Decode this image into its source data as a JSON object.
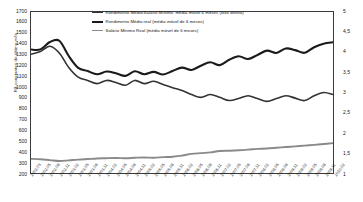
{
  "chart_data": {
    "type": "line",
    "title": "",
    "xlabel": "",
    "ylabel": "R$ constantes do último mês",
    "ylabel_right": "",
    "ylim": [
      200,
      1700
    ],
    "ylim_right": [
      1,
      5
    ],
    "grid": false,
    "legend_position": "top-center",
    "yticks": [
      1700,
      1600,
      1500,
      1400,
      1300,
      1200,
      1100,
      1000,
      900,
      800,
      700,
      600,
      500,
      400,
      300,
      200
    ],
    "yticks_right": [
      5,
      4.5,
      4,
      3.5,
      3,
      2.5,
      2,
      1.5,
      1
    ],
    "x": [
      "2002.03",
      "2002.05",
      "2002.08",
      "2002.11",
      "2003.02",
      "2003.05",
      "2003.08",
      "2003.11",
      "2004.02",
      "2004.05",
      "2004.08",
      "2004.11",
      "2005.02",
      "2005.05",
      "2005.08",
      "2005.11",
      "2006.02",
      "2006.05",
      "2006.08",
      "2006.11",
      "2007.02",
      "2007.05",
      "2007.08",
      "2007.11",
      "2008.02",
      "2008.05",
      "2008.08",
      "2008.11",
      "2009.02",
      "2009.05",
      "2009.08",
      "2009.11",
      "2010.02"
    ],
    "series": [
      {
        "name": "Rendimento Médio/Salário Mínimo: média móvel 6 meses (eixo direito)",
        "axis": "right",
        "color": "#333333",
        "width": 1.6,
        "values": [
          3.95,
          4.02,
          4.15,
          3.98,
          3.62,
          3.38,
          3.3,
          3.22,
          3.3,
          3.25,
          3.18,
          3.3,
          3.22,
          3.28,
          3.2,
          3.12,
          3.05,
          2.95,
          2.88,
          2.95,
          2.88,
          2.8,
          2.85,
          2.92,
          2.85,
          2.78,
          2.85,
          2.92,
          2.86,
          2.8,
          2.92,
          3.0,
          2.95
        ]
      },
      {
        "name": "Rendimento Médio real (média móvel de 6 meses)",
        "axis": "left",
        "color": "#1a1a1a",
        "width": 2.1,
        "values": [
          1350,
          1352,
          1420,
          1432,
          1290,
          1180,
          1150,
          1120,
          1145,
          1130,
          1105,
          1148,
          1120,
          1142,
          1118,
          1150,
          1182,
          1160,
          1200,
          1232,
          1205,
          1255,
          1288,
          1262,
          1300,
          1340,
          1318,
          1360,
          1345,
          1320,
          1372,
          1405,
          1418
        ]
      },
      {
        "name": "Salário Mínimo Real (média móvel de 6 meses)",
        "axis": "left",
        "color": "#8a8a8a",
        "width": 1.9,
        "values": [
          332,
          328,
          320,
          312,
          318,
          325,
          330,
          335,
          338,
          340,
          338,
          342,
          345,
          342,
          348,
          352,
          362,
          378,
          385,
          392,
          405,
          408,
          412,
          418,
          425,
          428,
          435,
          442,
          448,
          455,
          462,
          470,
          478
        ]
      }
    ]
  },
  "legend": [
    {
      "label": "Rendimento Médio/Salário Mínimo: média móvel 6 meses (eixo direito)",
      "color": "#333333",
      "thickness": "1.6px"
    },
    {
      "label": "Rendimento Médio real (média móvel de 6 meses)",
      "color": "#1a1a1a",
      "thickness": "2.2px"
    },
    {
      "label": "Salário Mínimo Real (média móvel de 6 meses)",
      "color": "#8a8a8a",
      "thickness": "1.6px"
    }
  ]
}
